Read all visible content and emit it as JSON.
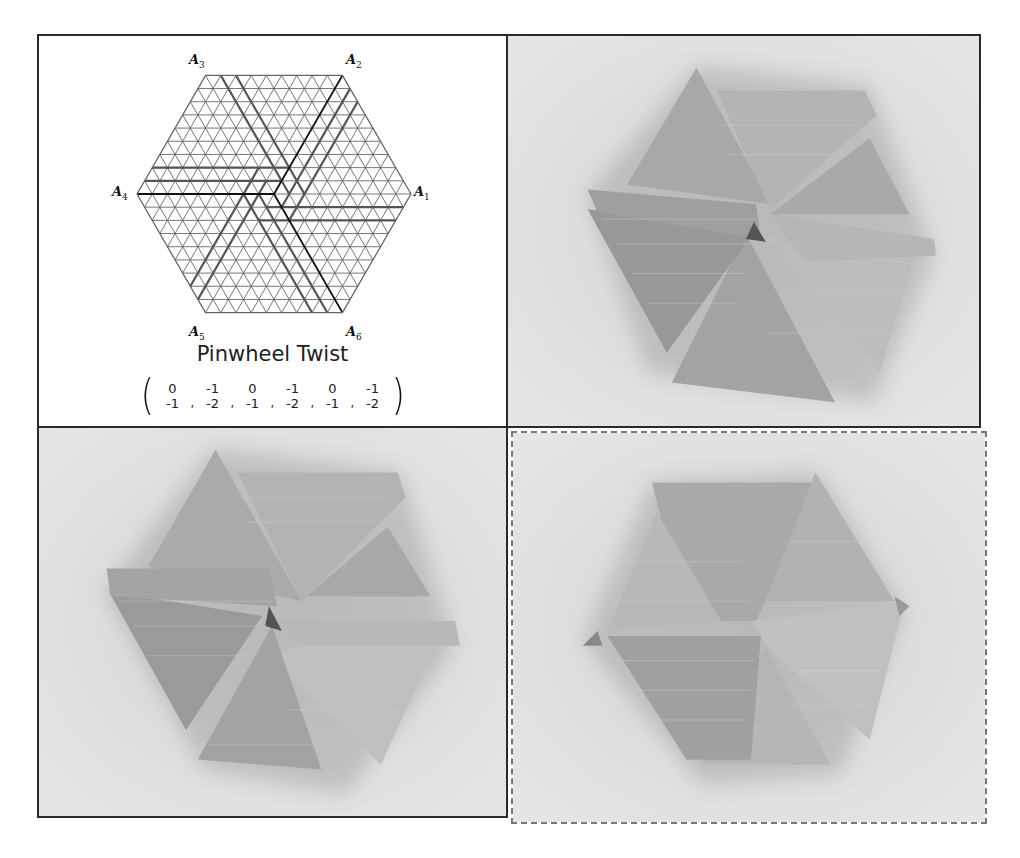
{
  "figure": {
    "diagram_panel": {
      "title": "Pinwheel Twist",
      "vertex_labels": [
        {
          "id": "A1",
          "base": "A",
          "sub": "1"
        },
        {
          "id": "A2",
          "base": "A",
          "sub": "2"
        },
        {
          "id": "A3",
          "base": "A",
          "sub": "3"
        },
        {
          "id": "A4",
          "base": "A",
          "sub": "4"
        },
        {
          "id": "A5",
          "base": "A",
          "sub": "5"
        },
        {
          "id": "A6",
          "base": "A",
          "sub": "6"
        }
      ],
      "vectors": [
        {
          "top": "0",
          "bottom": "-1"
        },
        {
          "top": "-1",
          "bottom": "-2"
        },
        {
          "top": "0",
          "bottom": "-1"
        },
        {
          "top": "-1",
          "bottom": "-2"
        },
        {
          "top": "0",
          "bottom": "-1"
        },
        {
          "top": "-1",
          "bottom": "-2"
        }
      ],
      "separator": ",",
      "grid_color": "#666666",
      "fold_line_color": "#555555",
      "axis_line_color": "#111111"
    },
    "photos": [
      {
        "id": "photo-top-right",
        "subject": "folded pinwheel twist, view 1",
        "border": "solid"
      },
      {
        "id": "photo-bottom-left",
        "subject": "folded pinwheel twist, view 2",
        "border": "solid"
      },
      {
        "id": "photo-bottom-right",
        "subject": "folded pinwheel twist, view 3 (flattened)",
        "border": "dashed"
      }
    ]
  }
}
